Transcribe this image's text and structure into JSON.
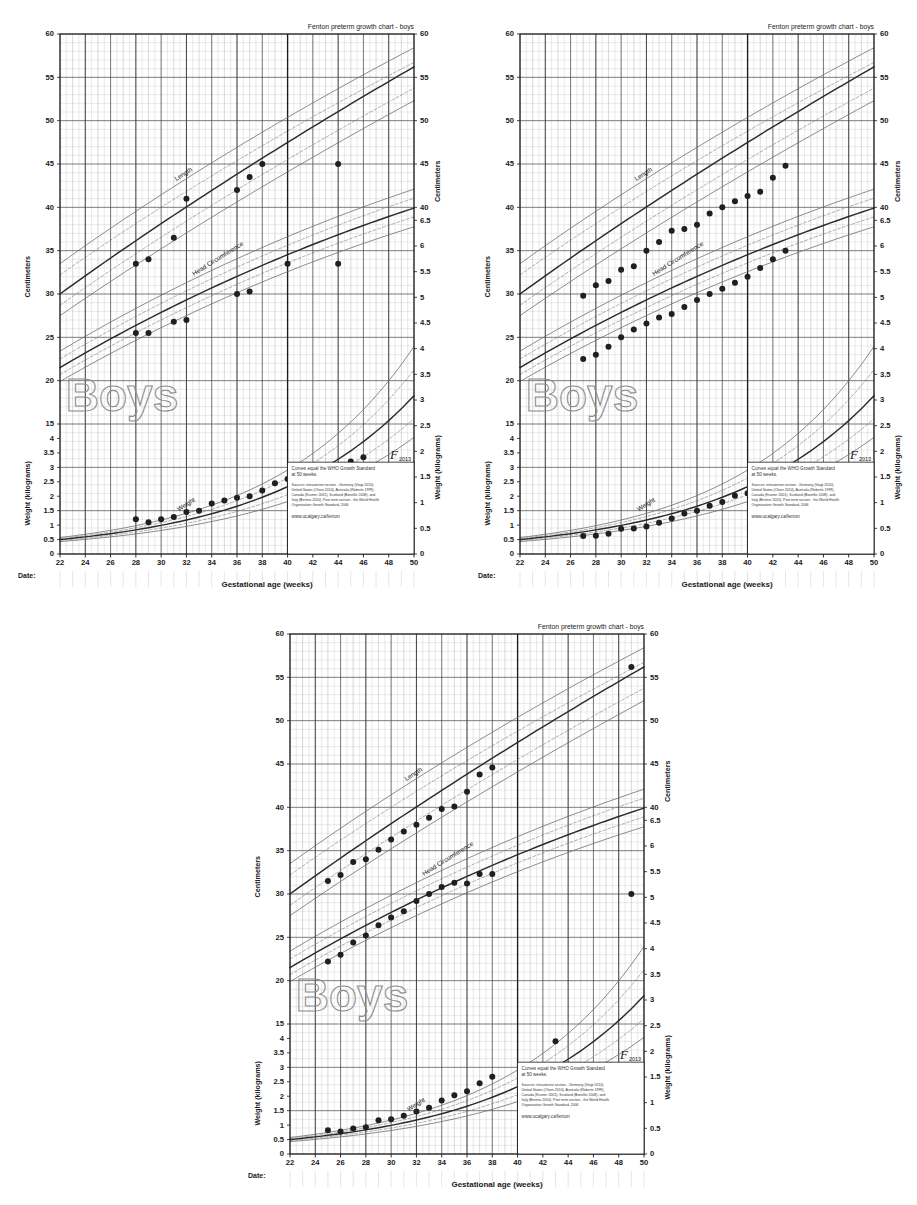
{
  "page": {
    "title": "Fenton preterm growth chart - boys",
    "background": "#ffffff",
    "charts_count": 3
  },
  "labels": {
    "header_title": "Fenton preterm growth chart - boys",
    "y_left_top": "Centimeters",
    "y_left_bottom": "Weight (kilograms)",
    "y_right_top": "Centimeters",
    "y_right_bottom": "Weight (kilograms)",
    "x_axis": "Gestational age (weeks)",
    "date_label": "Date:",
    "watermark": "Boys",
    "curve_length": "Length",
    "curve_head": "Head Circumference",
    "curve_weight": "Weight",
    "logo_mark": "F",
    "logo_year": "2013",
    "note_line1": "Curves equal the WHO Growth Standard",
    "note_line2": "at 50 weeks.",
    "sources_line1": "Sources: intrauterine section - Germany (Voigt 2010),",
    "sources_line2": "United States (Olsen 2010), Australia (Roberts 1999),",
    "sources_line3": "Canada (Kramer 2001), Scotland (Bonellie 2008), and",
    "sources_line4": "Italy (Bertino 2010). Post term section - the World Health",
    "sources_line5": "Organization Growth Standard, 2006",
    "website": "www.ucalgary.ca/fenton"
  },
  "colors": {
    "ink": "#1a1a1a",
    "grid_minor": "#b9b9b9",
    "grid_major": "#3a3a3a",
    "curve_main": "#2b2b2b",
    "curve_outer": "#6f6f6f",
    "marker": "#1f1f1f",
    "watermark": "#8d8d8d",
    "paper": "#ffffff"
  },
  "chart_data": [
    {
      "id": "chart-1",
      "type": "scatter",
      "title": "Fenton preterm growth chart - boys",
      "xlabel": "Gestational age (weeks)",
      "ylabel": "Centimeters",
      "ylabel_secondary": "Weight (kilograms)",
      "xlim": [
        22,
        50
      ],
      "xticks": [
        22,
        24,
        26,
        28,
        30,
        32,
        34,
        36,
        38,
        40,
        42,
        44,
        46,
        48,
        50
      ],
      "ylim_cm": [
        0,
        60
      ],
      "yticks_cm": [
        0,
        5,
        10,
        15,
        20,
        25,
        30,
        35,
        40,
        45,
        50,
        55,
        60
      ],
      "ylim_kg": [
        0,
        4.5
      ],
      "yticks_kg": [
        0,
        0.5,
        1,
        1.5,
        2,
        2.5,
        3,
        3.5,
        4,
        4.5
      ],
      "yticks_right_upper": [
        40,
        45,
        50,
        55,
        60
      ],
      "yticks_right_lower": [
        3,
        3.5,
        4,
        4.5,
        5,
        5.5,
        6,
        6.5
      ],
      "grid": true,
      "series": [
        {
          "name": "Length",
          "unit": "cm",
          "x": [
            28,
            29,
            31,
            32,
            36,
            37,
            38,
            40,
            44
          ],
          "values": [
            33.5,
            34.0,
            36.5,
            41.0,
            42.0,
            43.5,
            45.0,
            33.5,
            45.0
          ]
        },
        {
          "name": "Head Circumference",
          "unit": "cm",
          "x": [
            28,
            29,
            31,
            32,
            36,
            37,
            44
          ],
          "values": [
            25.5,
            25.5,
            26.8,
            27.0,
            30.0,
            30.3,
            33.5
          ]
        },
        {
          "name": "Weight",
          "unit": "kg",
          "x": [
            28,
            29,
            30,
            31,
            32,
            33,
            34,
            35,
            36,
            37,
            38,
            39,
            40,
            43,
            44,
            45,
            46
          ],
          "values": [
            1.2,
            1.1,
            1.2,
            1.28,
            1.45,
            1.5,
            1.75,
            1.85,
            1.95,
            2.0,
            2.2,
            2.45,
            2.6,
            2.9,
            3.0,
            3.2,
            3.35
          ]
        }
      ]
    },
    {
      "id": "chart-2",
      "type": "scatter",
      "title": "Fenton preterm growth chart - boys",
      "xlabel": "Gestational age (weeks)",
      "ylabel": "Centimeters",
      "ylabel_secondary": "Weight (kilograms)",
      "xlim": [
        22,
        50
      ],
      "xticks": [
        22,
        24,
        26,
        28,
        30,
        32,
        34,
        36,
        38,
        40,
        42,
        44,
        46,
        48,
        50
      ],
      "ylim_cm": [
        0,
        60
      ],
      "yticks_cm": [
        0,
        5,
        10,
        15,
        20,
        25,
        30,
        35,
        40,
        45,
        50,
        55,
        60
      ],
      "ylim_kg": [
        0,
        4.5
      ],
      "yticks_kg": [
        0,
        0.5,
        1,
        1.5,
        2,
        2.5,
        3,
        3.5,
        4,
        4.5
      ],
      "yticks_right_upper": [
        40,
        45,
        50,
        55,
        60
      ],
      "yticks_right_lower": [
        3,
        3.5,
        4,
        4.5,
        5,
        5.5,
        6,
        6.5
      ],
      "grid": true,
      "series": [
        {
          "name": "Length",
          "unit": "cm",
          "x": [
            27,
            28,
            29,
            30,
            31,
            32,
            33,
            34,
            35,
            36,
            37,
            38,
            39,
            40,
            41,
            42,
            43
          ],
          "values": [
            29.8,
            31.0,
            31.5,
            32.8,
            33.2,
            35.0,
            36.0,
            37.3,
            37.5,
            38.0,
            39.3,
            40.0,
            40.7,
            41.3,
            41.8,
            43.4,
            44.8
          ]
        },
        {
          "name": "Head Circumference",
          "unit": "cm",
          "x": [
            27,
            28,
            29,
            30,
            31,
            32,
            33,
            34,
            35,
            36,
            37,
            38,
            39,
            40,
            41,
            42,
            43
          ],
          "values": [
            22.5,
            23.0,
            23.9,
            25.0,
            25.9,
            26.6,
            27.3,
            27.7,
            28.5,
            29.3,
            30.0,
            30.6,
            31.3,
            32.0,
            33.0,
            34.0,
            35.0
          ]
        },
        {
          "name": "Weight",
          "unit": "kg",
          "x": [
            27,
            28,
            29,
            30,
            31,
            32,
            33,
            34,
            35,
            36,
            37,
            38,
            39,
            40,
            41,
            42,
            43
          ],
          "values": [
            0.62,
            0.63,
            0.7,
            0.87,
            0.88,
            0.95,
            1.08,
            1.23,
            1.4,
            1.5,
            1.67,
            1.8,
            2.02,
            2.1,
            2.28,
            2.45,
            2.65
          ]
        }
      ]
    },
    {
      "id": "chart-3",
      "type": "scatter",
      "title": "Fenton preterm growth chart - boys",
      "xlabel": "Gestational age (weeks)",
      "ylabel": "Centimeters",
      "ylabel_secondary": "Weight (kilograms)",
      "xlim": [
        22,
        50
      ],
      "xticks": [
        22,
        24,
        26,
        28,
        30,
        32,
        34,
        36,
        38,
        40,
        42,
        44,
        46,
        48,
        50
      ],
      "ylim_cm": [
        0,
        60
      ],
      "yticks_cm": [
        0,
        5,
        10,
        15,
        20,
        25,
        30,
        35,
        40,
        45,
        50,
        55,
        60
      ],
      "ylim_kg": [
        0,
        4.5
      ],
      "yticks_kg": [
        0,
        0.5,
        1,
        1.5,
        2,
        2.5,
        3,
        3.5,
        4,
        4.5
      ],
      "yticks_right_upper": [
        40,
        45,
        50,
        55,
        60
      ],
      "yticks_right_lower": [
        3,
        3.5,
        4,
        4.5,
        5,
        5.5,
        6,
        6.5
      ],
      "grid": true,
      "series": [
        {
          "name": "Length",
          "unit": "cm",
          "x": [
            25,
            26,
            27,
            28,
            29,
            30,
            31,
            32,
            33,
            34,
            35,
            36,
            37,
            38,
            49
          ],
          "values": [
            31.5,
            32.2,
            33.7,
            34.0,
            35.1,
            36.3,
            37.2,
            38.0,
            38.8,
            39.8,
            40.1,
            41.8,
            43.8,
            44.6,
            56.2
          ]
        },
        {
          "name": "Head Circumference",
          "unit": "cm",
          "x": [
            25,
            26,
            27,
            28,
            29,
            30,
            31,
            32,
            33,
            34,
            35,
            36,
            37,
            38,
            49
          ],
          "values": [
            22.2,
            23.0,
            24.4,
            25.2,
            26.4,
            27.3,
            28.0,
            29.2,
            30.0,
            30.8,
            31.3,
            31.2,
            32.3,
            32.3,
            30.0
          ]
        },
        {
          "name": "Weight",
          "unit": "kg",
          "x": [
            25,
            26,
            27,
            28,
            29,
            30,
            31,
            32,
            33,
            34,
            35,
            36,
            37,
            38,
            43
          ],
          "values": [
            0.82,
            0.78,
            0.88,
            0.93,
            1.17,
            1.2,
            1.32,
            1.47,
            1.6,
            1.85,
            2.03,
            2.17,
            2.45,
            2.67,
            3.9
          ]
        }
      ]
    }
  ]
}
